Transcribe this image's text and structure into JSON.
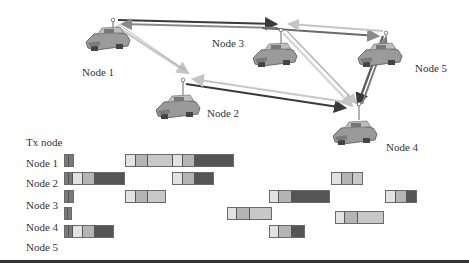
{
  "colors": {
    "light": "#e2e2e2",
    "mid": "#b4b4b4",
    "lightmid": "#c8c8c8",
    "dark": "#555555",
    "marker": "#7a7a7a",
    "arrow_dark": "#3a3a3a",
    "arrow_mid": "#8a8a8a",
    "arrow_light": "#cfcfcf"
  },
  "network": {
    "nodes": [
      {
        "id": "node1",
        "label": "Node 1",
        "label_x": 82,
        "label_y": 66
      },
      {
        "id": "node2",
        "label": "Node 2",
        "label_x": 207,
        "label_y": 107
      },
      {
        "id": "node3",
        "label": "Node 3",
        "label_x": 212,
        "label_y": 37
      },
      {
        "id": "node4",
        "label": "Node 4",
        "label_x": 386,
        "label_y": 141
      },
      {
        "id": "node5",
        "label": "Node 5",
        "label_x": 415,
        "label_y": 62
      }
    ]
  },
  "timeline": {
    "header": "Tx node",
    "rows": [
      {
        "label": "Node 1"
      },
      {
        "label": "Node 2"
      },
      {
        "label": "Node 3"
      },
      {
        "label": "Node 4"
      },
      {
        "label": "Node 5"
      }
    ],
    "bars": [
      {
        "x": 64,
        "y": 154,
        "segs": [
          [
            "marker",
            4
          ],
          [
            "marker",
            4
          ]
        ]
      },
      {
        "x": 125,
        "y": 154,
        "segs": [
          [
            "light",
            10
          ],
          [
            "mid",
            12
          ],
          [
            "lightmid",
            25
          ],
          [
            "light",
            10
          ],
          [
            "mid",
            12
          ],
          [
            "dark",
            38
          ]
        ]
      },
      {
        "x": 64,
        "y": 172,
        "segs": [
          [
            "marker",
            4
          ],
          [
            "marker",
            4
          ],
          [
            "light",
            10
          ],
          [
            "mid",
            12
          ],
          [
            "dark",
            29
          ]
        ]
      },
      {
        "x": 172,
        "y": 172,
        "segs": [
          [
            "light",
            10
          ],
          [
            "mid",
            12
          ],
          [
            "dark",
            18
          ]
        ]
      },
      {
        "x": 331,
        "y": 172,
        "segs": [
          [
            "light",
            10
          ],
          [
            "mid",
            11
          ],
          [
            "lightmid",
            9
          ]
        ]
      },
      {
        "x": 64,
        "y": 190,
        "segs": [
          [
            "marker",
            4
          ],
          [
            "marker",
            4
          ]
        ]
      },
      {
        "x": 125,
        "y": 190,
        "segs": [
          [
            "light",
            10
          ],
          [
            "mid",
            12
          ],
          [
            "lightmid",
            17
          ]
        ]
      },
      {
        "x": 269,
        "y": 190,
        "segs": [
          [
            "light",
            9
          ],
          [
            "mid",
            13
          ],
          [
            "dark",
            37
          ]
        ]
      },
      {
        "x": 385,
        "y": 190,
        "segs": [
          [
            "light",
            10
          ],
          [
            "mid",
            11
          ],
          [
            "dark",
            9
          ]
        ]
      },
      {
        "x": 64,
        "y": 207,
        "segs": [
          [
            "marker",
            3
          ],
          [
            "marker",
            3
          ]
        ]
      },
      {
        "x": 227,
        "y": 207,
        "segs": [
          [
            "light",
            9
          ],
          [
            "mid",
            13
          ],
          [
            "lightmid",
            21
          ]
        ]
      },
      {
        "x": 335,
        "y": 211,
        "segs": [
          [
            "light",
            9
          ],
          [
            "mid",
            13
          ],
          [
            "lightmid",
            25
          ]
        ]
      },
      {
        "x": 64,
        "y": 225,
        "segs": [
          [
            "marker",
            4
          ],
          [
            "marker",
            4
          ],
          [
            "light",
            10
          ],
          [
            "mid",
            12
          ],
          [
            "dark",
            18
          ]
        ]
      },
      {
        "x": 269,
        "y": 225,
        "segs": [
          [
            "light",
            9
          ],
          [
            "mid",
            13
          ],
          [
            "dark",
            12
          ]
        ]
      }
    ]
  }
}
